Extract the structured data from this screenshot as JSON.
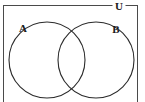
{
  "figure": {
    "kind": "venn-diagram",
    "background_color": "#ffffff",
    "stroke_color": "#2b2b2b",
    "rect_stroke_color": "#4a4a4a",
    "text_color": "#1a1a1a"
  },
  "universal_set": {
    "label": "U",
    "label_x": 118,
    "label_y": 6,
    "font_size": 11,
    "rect": {
      "x": 3.5,
      "y": 5.5,
      "width": 134,
      "height": 96,
      "gap_start_x": 112,
      "gap_end_x": 126
    }
  },
  "sets": [
    {
      "label": "A",
      "label_x": 23,
      "label_y": 28,
      "font_size": 11,
      "circle": {
        "cx": 47,
        "cy": 60,
        "r": 38
      }
    },
    {
      "label": "B",
      "label_x": 116,
      "label_y": 29,
      "font_size": 11,
      "circle": {
        "cx": 96,
        "cy": 60,
        "r": 38
      }
    }
  ],
  "geometry": {
    "canvas_width": 145,
    "canvas_height": 102,
    "stroke_width": 1.1,
    "rect_stroke_width": 1
  }
}
